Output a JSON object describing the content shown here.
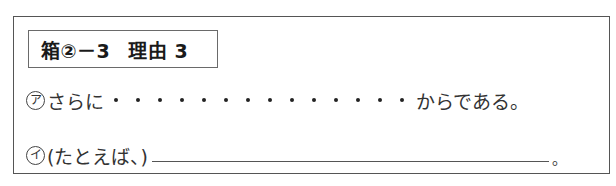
{
  "header": {
    "box_label": "箱②－3",
    "title": "理由 3"
  },
  "rows": [
    {
      "marker": "ア",
      "prefix": "さらに",
      "dot_count": 14,
      "suffix": "からである。"
    },
    {
      "marker": "イ",
      "prefix": "(たとえば、)",
      "blank": "",
      "suffix": "。"
    }
  ]
}
